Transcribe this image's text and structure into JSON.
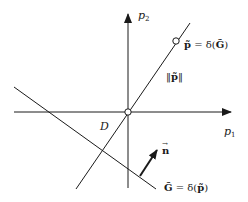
{
  "diagram": {
    "type": "geometric-construction",
    "stroke_color": "#1a1a1a",
    "background": "#ffffff",
    "axes": {
      "x_label": "p",
      "x_subscript": "1",
      "y_label": "p",
      "y_subscript": "2"
    },
    "labels": {
      "p_tilde_eq": "p̃ = δ(G̃)",
      "p_tilde": "p̃",
      "eq": " = δ(",
      "G_tilde": "G̃",
      "close": ")",
      "norm_open": "‖",
      "norm_p": "p̃",
      "norm_close": "‖",
      "region_D": "D",
      "normal_n": "n⃗",
      "n_letter": "n",
      "n_arrow": "→",
      "G_eq_G": "G̃",
      "G_eq_rest": " = δ(",
      "G_eq_p": "p̃",
      "G_eq_close": ")"
    },
    "elements": [
      {
        "name": "x-axis",
        "description": "horizontal axis with arrow pointing right"
      },
      {
        "name": "y-axis",
        "description": "vertical axis with arrow pointing up"
      },
      {
        "name": "line-p",
        "description": "line through origin and point p̃"
      },
      {
        "name": "line-G",
        "description": "line G̃ with negative slope"
      },
      {
        "name": "normal-vector-n",
        "description": "arrow perpendicular to line G̃"
      },
      {
        "name": "origin-point",
        "description": "open circle at origin"
      },
      {
        "name": "point-p",
        "description": "open circle at p̃ on line"
      }
    ]
  }
}
